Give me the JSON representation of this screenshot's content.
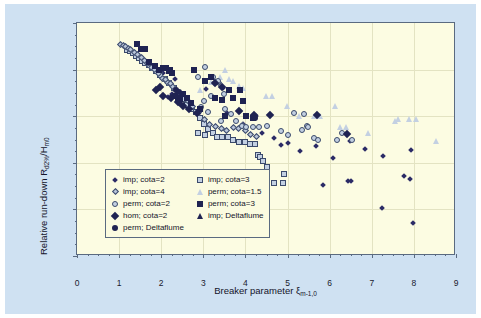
{
  "chart_data": {
    "type": "scatter",
    "title": "",
    "xlabel": "Breaker parameter ξ",
    "xlabel_sub": "m-1,0",
    "ylabel": "Relative run-down R",
    "ylabel_sub1": "d2%",
    "ylabel_mid": "/H",
    "ylabel_sub2": "m0",
    "xlim": [
      0,
      9
    ],
    "ylim": [
      2.5,
      0.0
    ],
    "y_inverted": true,
    "xticks": [
      "0",
      "1",
      "2",
      "3",
      "4",
      "5",
      "6",
      "7",
      "8",
      "9"
    ],
    "yticks": [
      "0.0",
      "0.5",
      "1.0",
      "1.5",
      "2.0",
      "2.5"
    ],
    "grid": true,
    "legend_position": "lower-left-inside",
    "plot_bg": "#fcfce2",
    "figure_bg": "#cfe1f2",
    "axis_color": "#5a6a80",
    "series": [
      {
        "name": "imp; cota=2",
        "marker": "diamond-navy",
        "color": "#2b2b66",
        "points": [
          [
            3.3,
            0.66
          ],
          [
            3.52,
            0.72
          ],
          [
            3.62,
            0.99
          ],
          [
            3.92,
            0.97
          ],
          [
            4.05,
            1.02
          ],
          [
            4.3,
            1.02
          ],
          [
            2.92,
            1.0
          ],
          [
            3.12,
            0.73
          ],
          [
            2.45,
            0.79
          ],
          [
            2.3,
            0.78
          ],
          [
            2.2,
            0.82
          ],
          [
            2.1,
            0.56
          ],
          [
            2.05,
            0.52
          ],
          [
            2.38,
            0.62
          ],
          [
            5.05,
            1.31
          ],
          [
            4.88,
            1.33
          ],
          [
            5.35,
            1.4
          ],
          [
            5.72,
            1.34
          ],
          [
            5.9,
            1.76
          ],
          [
            6.12,
            1.47
          ],
          [
            6.48,
            1.72
          ],
          [
            6.55,
            1.72
          ],
          [
            6.52,
            1.29
          ],
          [
            6.88,
            1.37
          ],
          [
            7.3,
            2.01
          ],
          [
            7.32,
            1.45
          ],
          [
            7.82,
            1.66
          ],
          [
            7.95,
            1.7
          ],
          [
            7.98,
            1.38
          ],
          [
            8.02,
            2.17
          ],
          [
            4.72,
            1.25
          ],
          [
            3.98,
            1.1
          ],
          [
            2.72,
            0.9
          ],
          [
            2.62,
            0.86
          ],
          [
            4.45,
            1.2
          ]
        ]
      },
      {
        "name": "imp; cota=3",
        "marker": "square-light",
        "color": "#c3d0e2",
        "points": [
          [
            1.18,
            0.29
          ],
          [
            1.26,
            0.3
          ],
          [
            1.34,
            0.32
          ],
          [
            1.4,
            0.35
          ],
          [
            1.48,
            0.38
          ],
          [
            1.55,
            0.41
          ],
          [
            1.62,
            0.43
          ],
          [
            1.7,
            0.45
          ],
          [
            1.78,
            0.48
          ],
          [
            1.88,
            0.52
          ],
          [
            1.98,
            0.56
          ],
          [
            2.08,
            0.6
          ],
          [
            2.18,
            0.64
          ],
          [
            2.3,
            0.7
          ],
          [
            2.4,
            0.75
          ],
          [
            2.52,
            0.82
          ],
          [
            2.62,
            0.88
          ],
          [
            2.72,
            0.92
          ],
          [
            2.82,
            0.96
          ],
          [
            2.92,
            1.02
          ],
          [
            3.02,
            1.08
          ],
          [
            3.12,
            1.14
          ],
          [
            3.22,
            1.18
          ],
          [
            3.32,
            1.22
          ],
          [
            3.45,
            1.22
          ],
          [
            3.58,
            1.22
          ],
          [
            3.7,
            1.25
          ],
          [
            3.85,
            1.28
          ],
          [
            4.0,
            1.28
          ],
          [
            4.12,
            1.3
          ],
          [
            4.22,
            1.3
          ],
          [
            4.3,
            1.42
          ],
          [
            4.35,
            1.44
          ],
          [
            4.42,
            1.48
          ],
          [
            4.52,
            1.54
          ],
          [
            4.68,
            1.72
          ],
          [
            4.88,
            1.72
          ],
          [
            4.92,
            1.62
          ],
          [
            2.88,
            1.18
          ],
          [
            3.05,
            1.2
          ]
        ]
      },
      {
        "name": "imp; cota=4",
        "marker": "diamond-light",
        "color": "#b9c6da",
        "points": [
          [
            1.1,
            0.26
          ],
          [
            1.16,
            0.27
          ],
          [
            1.22,
            0.28
          ],
          [
            1.28,
            0.3
          ],
          [
            1.34,
            0.31
          ],
          [
            1.42,
            0.34
          ],
          [
            1.5,
            0.37
          ],
          [
            1.58,
            0.4
          ],
          [
            1.66,
            0.43
          ],
          [
            1.74,
            0.46
          ],
          [
            1.82,
            0.5
          ],
          [
            1.9,
            0.53
          ],
          [
            2.0,
            0.57
          ],
          [
            2.1,
            0.62
          ],
          [
            2.2,
            0.66
          ],
          [
            2.32,
            0.71
          ],
          [
            2.42,
            0.75
          ],
          [
            2.55,
            0.8
          ],
          [
            2.68,
            0.86
          ],
          [
            2.8,
            0.92
          ],
          [
            2.95,
            0.99
          ],
          [
            3.08,
            1.06
          ],
          [
            3.2,
            1.12
          ],
          [
            3.35,
            1.14
          ],
          [
            3.5,
            1.16
          ],
          [
            3.62,
            1.18
          ],
          [
            3.78,
            1.15
          ],
          [
            3.9,
            1.16
          ],
          [
            4.05,
            1.18
          ],
          [
            4.18,
            1.22
          ],
          [
            4.32,
            1.24
          ],
          [
            2.15,
            0.63
          ],
          [
            2.28,
            0.68
          ],
          [
            3.42,
            0.66
          ],
          [
            3.98,
            1.13
          ]
        ]
      },
      {
        "name": "perm; cota=1.5",
        "marker": "tri-light",
        "color": "#c3d0e2",
        "points": [
          [
            3.4,
            0.58
          ],
          [
            3.52,
            0.5
          ],
          [
            3.7,
            0.62
          ],
          [
            3.85,
            0.68
          ],
          [
            3.95,
            0.7
          ],
          [
            4.48,
            0.78
          ],
          [
            4.62,
            0.78
          ],
          [
            4.98,
            0.89
          ],
          [
            5.28,
            1.0
          ],
          [
            5.62,
            1.0
          ],
          [
            5.78,
            1.0
          ],
          [
            6.12,
            0.89
          ],
          [
            6.25,
            1.12
          ],
          [
            6.38,
            1.12
          ],
          [
            6.9,
            1.18
          ],
          [
            7.55,
            1.05
          ],
          [
            7.62,
            1.03
          ],
          [
            7.88,
            1.03
          ],
          [
            8.05,
            1.03
          ],
          [
            8.52,
            1.27
          ],
          [
            3.28,
            0.62
          ],
          [
            3.18,
            0.63
          ],
          [
            2.92,
            0.72
          ],
          [
            3.6,
            0.6
          ]
        ]
      },
      {
        "name": "perm; cota=2",
        "marker": "circle-light",
        "color": "#c3d0e2",
        "points": [
          [
            2.88,
            0.58
          ],
          [
            3.05,
            0.47
          ],
          [
            3.22,
            0.58
          ],
          [
            3.35,
            0.62
          ],
          [
            3.48,
            0.76
          ],
          [
            3.18,
            0.78
          ],
          [
            3.02,
            0.84
          ],
          [
            2.95,
            0.9
          ],
          [
            3.52,
            0.92
          ],
          [
            3.65,
            0.98
          ],
          [
            3.78,
            1.05
          ],
          [
            3.92,
            1.1
          ],
          [
            4.02,
            1.12
          ],
          [
            4.18,
            1.12
          ],
          [
            4.32,
            1.12
          ],
          [
            4.85,
            1.16
          ],
          [
            5.02,
            1.2
          ],
          [
            5.15,
            0.97
          ],
          [
            5.35,
            1.15
          ],
          [
            5.45,
            1.1
          ],
          [
            5.48,
            1.12
          ],
          [
            5.62,
            1.23
          ],
          [
            5.72,
            1.26
          ],
          [
            6.18,
            1.26
          ],
          [
            6.3,
            1.18
          ],
          [
            6.52,
            1.26
          ],
          [
            5.4,
            0.98
          ],
          [
            4.52,
            1.1
          ],
          [
            3.42,
            1.05
          ],
          [
            3.12,
            0.96
          ]
        ]
      },
      {
        "name": "perm; cota=3",
        "marker": "square-navy",
        "color": "#1f2352",
        "points": [
          [
            1.42,
            0.23
          ],
          [
            1.52,
            0.28
          ],
          [
            1.62,
            0.28
          ],
          [
            1.72,
            0.42
          ],
          [
            1.85,
            0.46
          ],
          [
            1.95,
            0.5
          ],
          [
            2.05,
            0.48
          ],
          [
            2.12,
            0.48
          ],
          [
            2.18,
            0.52
          ],
          [
            2.25,
            0.54
          ],
          [
            2.32,
            0.78
          ],
          [
            2.4,
            0.8
          ],
          [
            2.52,
            0.76
          ],
          [
            2.62,
            0.8
          ],
          [
            2.78,
            0.5
          ],
          [
            2.92,
            0.92
          ],
          [
            3.05,
            0.62
          ],
          [
            3.18,
            0.58
          ],
          [
            3.28,
            0.8
          ],
          [
            3.45,
            0.83
          ],
          [
            3.62,
            0.72
          ],
          [
            3.7,
            0.8
          ],
          [
            3.88,
            0.72
          ],
          [
            3.95,
            0.84
          ],
          [
            4.02,
            1.0
          ],
          [
            4.18,
            1.02
          ],
          [
            2.7,
            0.86
          ],
          [
            2.45,
            0.82
          ],
          [
            3.52,
            1.0
          ],
          [
            2.22,
            0.5
          ]
        ]
      },
      {
        "name": "hom; cota=2",
        "marker": "diamond-big-navy",
        "color": "#1f2352",
        "points": [
          [
            2.05,
            0.72
          ],
          [
            2.12,
            0.82
          ],
          [
            2.3,
            0.84
          ],
          [
            2.48,
            0.88
          ],
          [
            2.6,
            0.92
          ],
          [
            2.72,
            0.96
          ],
          [
            3.35,
            0.68
          ],
          [
            3.52,
            0.72
          ],
          [
            3.92,
            0.98
          ],
          [
            4.28,
            1.02
          ],
          [
            4.65,
            1.02
          ],
          [
            2.92,
            1.0
          ],
          [
            5.78,
            1.02
          ],
          [
            6.48,
            1.22
          ],
          [
            1.95,
            0.75
          ]
        ]
      },
      {
        "name": "perm; Deltaflume",
        "marker": "circle-navy",
        "color": "#1f2352",
        "points": [
          [
            2.35,
            0.72
          ],
          [
            2.42,
            0.74
          ],
          [
            4.02,
            1.0
          ],
          [
            4.22,
            1.02
          ]
        ]
      },
      {
        "name": "imp; Deltaflume",
        "marker": "tri-navy",
        "color": "#1f2352",
        "points": [
          [
            2.48,
            0.86
          ],
          [
            2.55,
            0.88
          ]
        ]
      }
    ]
  },
  "legend": {
    "items": [
      {
        "label": "imp; cota=2",
        "marker": "diamond-navy"
      },
      {
        "label": "imp; cota=3",
        "marker": "square-light"
      },
      {
        "label": "imp; cota=4",
        "marker": "diamond-light"
      },
      {
        "label": "perm; cota=1.5",
        "marker": "tri-light"
      },
      {
        "label": "perm; cota=2",
        "marker": "circle-light"
      },
      {
        "label": "perm; cota=3",
        "marker": "square-navy"
      },
      {
        "label": "hom; cota=2",
        "marker": "diamond-big-navy"
      },
      {
        "label": "imp; Deltaflume",
        "marker": "tri-navy"
      },
      {
        "label": "perm; Deltaflume",
        "marker": "circle-navy"
      }
    ]
  }
}
